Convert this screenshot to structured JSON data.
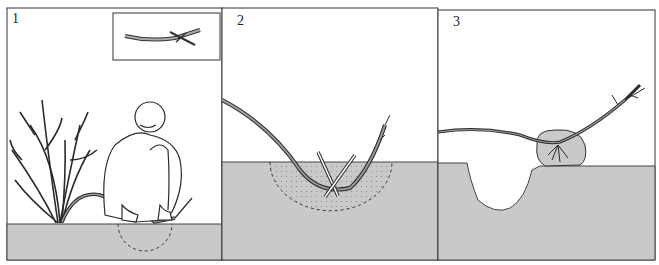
{
  "figure": {
    "colors": {
      "ground": "#c9c9c9",
      "line": "#2a2a2a",
      "background": "#ffffff",
      "branch_fill": "#9a9a9a"
    },
    "panels": [
      {
        "number": "1",
        "caption_visible": false,
        "scene": "person pegging bent shrub branch into ground; inset shows wounded branch"
      },
      {
        "number": "2",
        "scene": "branch pinned in soil with crossed pegs; dotted prepared soil area"
      },
      {
        "number": "3",
        "scene": "rooted layer lifted with root ball beside hole"
      }
    ]
  }
}
